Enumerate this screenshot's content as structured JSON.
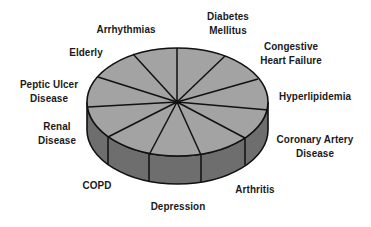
{
  "diagram": {
    "type": "3d-pie",
    "colors": {
      "top_face": "#a3a3a3",
      "side_face": "#6e6e6e",
      "outline": "#111111",
      "text": "#1a1a1a"
    },
    "slices": [
      {
        "label": [
          "Arrhythmias"
        ]
      },
      {
        "label": [
          "Diabetes",
          "Mellitus"
        ]
      },
      {
        "label": [
          "Congestive",
          "Heart Failure"
        ]
      },
      {
        "label": [
          "Hyperlipidemia"
        ]
      },
      {
        "label": [
          "Coronary Artery",
          "Disease"
        ]
      },
      {
        "label": [
          "Arthritis"
        ]
      },
      {
        "label": [
          "Depression"
        ]
      },
      {
        "label": [
          "COPD"
        ]
      },
      {
        "label": [
          "Renal",
          "Disease"
        ]
      },
      {
        "label": [
          "Peptic Ulcer",
          "Disease"
        ]
      },
      {
        "label": [
          "Elderly"
        ]
      }
    ]
  }
}
